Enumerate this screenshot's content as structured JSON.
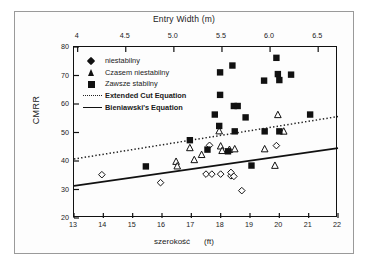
{
  "figure": {
    "top_axis_title": "Entry Width (m)",
    "bottom_axis_title": "szerokość",
    "bottom_axis_unit": "(ft)",
    "y_axis_title": "CMRR"
  },
  "legend": {
    "items": [
      {
        "label": "niestabilny",
        "marker": "filled-diamond",
        "bold": false
      },
      {
        "label": "Czasem niestabilny",
        "marker": "filled-triangle",
        "bold": false
      },
      {
        "label": "Zawsze stabilny",
        "marker": "filled-square",
        "bold": false
      },
      {
        "label": "Extended Cut Equation",
        "marker": "dotted-line",
        "bold": true
      },
      {
        "label": "Bieniawski's Equation",
        "marker": "solid-line",
        "bold": true
      }
    ]
  },
  "chart_data": {
    "type": "scatter",
    "title": "Entry Width (m)",
    "xlabel": "szerokość (ft)",
    "ylabel": "CMRR",
    "xlim": [
      13,
      22
    ],
    "ylim": [
      20,
      80
    ],
    "grid": false,
    "legend_position": "upper-left-inside",
    "x_top_axis": {
      "label": "Entry Width (m)",
      "ticks": [
        "4",
        "4.5",
        "5.0",
        "5.5",
        "6.0",
        "6.5"
      ],
      "tick_values": [
        4,
        4.5,
        5.0,
        5.5,
        6.0,
        6.5
      ],
      "lim": [
        3.962,
        6.706
      ],
      "unit": "m"
    },
    "x_bottom_axis": {
      "label": "szerokość (ft)",
      "ticks": [
        "13",
        "14",
        "15",
        "16",
        "17",
        "18",
        "19",
        "20",
        "21",
        "22"
      ],
      "tick_values": [
        13,
        14,
        15,
        16,
        17,
        18,
        19,
        20,
        21,
        22
      ],
      "unit": "ft"
    },
    "y_axis": {
      "label": "CMRR",
      "ticks": [
        "20",
        "30",
        "40",
        "50",
        "60",
        "70",
        "80"
      ],
      "tick_values": [
        20,
        30,
        40,
        50,
        60,
        70,
        80
      ]
    },
    "series": [
      {
        "name": "niestabilny",
        "marker": "open-diamond",
        "color": "#111111",
        "points": [
          [
            13.95,
            35.2
          ],
          [
            15.95,
            32.4
          ],
          [
            17.5,
            35.4
          ],
          [
            17.7,
            35.4
          ],
          [
            17.62,
            45.5
          ],
          [
            18.0,
            35.4
          ],
          [
            18.35,
            34.8
          ],
          [
            18.45,
            34.6
          ],
          [
            18.35,
            36.0
          ],
          [
            18.72,
            29.6
          ],
          [
            19.9,
            45.4
          ]
        ]
      },
      {
        "name": "Czasem niestabilny",
        "marker": "open-triangle",
        "color": "#111111",
        "points": [
          [
            16.48,
            39.8
          ],
          [
            16.52,
            38.2
          ],
          [
            16.95,
            44.6
          ],
          [
            17.1,
            40.4
          ],
          [
            17.35,
            42.2
          ],
          [
            17.95,
            50.5
          ],
          [
            18.0,
            45.2
          ],
          [
            18.05,
            43.6
          ],
          [
            18.3,
            44.0
          ],
          [
            18.48,
            44.2
          ],
          [
            19.5,
            44.2
          ],
          [
            19.85,
            38.4
          ],
          [
            19.95,
            56.2
          ],
          [
            20.15,
            50.4
          ]
        ]
      },
      {
        "name": "Zawsze stabilny",
        "marker": "filled-square",
        "color": "#111111",
        "points": [
          [
            15.45,
            38.1
          ],
          [
            16.95,
            47.3
          ],
          [
            17.55,
            44.0
          ],
          [
            17.8,
            56.3
          ],
          [
            17.98,
            71.1
          ],
          [
            17.98,
            63.2
          ],
          [
            17.95,
            52.3
          ],
          [
            18.25,
            43.4
          ],
          [
            18.4,
            73.5
          ],
          [
            18.45,
            59.3
          ],
          [
            18.58,
            59.3
          ],
          [
            18.48,
            50.4
          ],
          [
            18.85,
            55.3
          ],
          [
            19.05,
            38.4
          ],
          [
            19.48,
            68.2
          ],
          [
            19.5,
            50.4
          ],
          [
            19.9,
            76.2
          ],
          [
            19.95,
            70.5
          ],
          [
            20.0,
            68.4
          ],
          [
            20.0,
            50.4
          ],
          [
            20.4,
            70.3
          ],
          [
            21.05,
            56.3
          ]
        ]
      }
    ],
    "lines": [
      {
        "name": "Extended Cut Equation",
        "style": "dotted",
        "color": "#222222",
        "x": [
          13,
          22
        ],
        "y": [
          40.7,
          55.6
        ]
      },
      {
        "name": "Bieniawski's Equation",
        "style": "solid",
        "color": "#111111",
        "x": [
          13,
          22
        ],
        "y": [
          31.3,
          44.5
        ]
      }
    ]
  }
}
